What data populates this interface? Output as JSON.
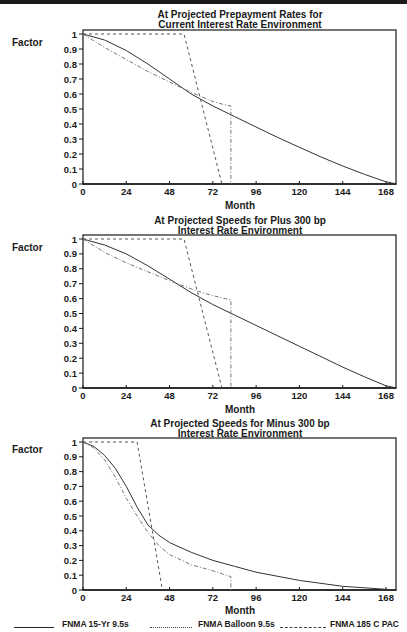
{
  "page": {
    "y_axis_label": "Factor",
    "x_axis_label": "Month"
  },
  "legend": [
    {
      "label": "FNMA 15-Yr 9.5s",
      "style": "solid"
    },
    {
      "label": "FNMA Balloon 9.5s",
      "style": "dashdot"
    },
    {
      "label": "FNMA 185 C PAC",
      "style": "dashed"
    }
  ],
  "chart_data": [
    {
      "type": "line",
      "title": "At Projected Prepayment Rates for",
      "subtitle": "Current Interest Rate Environment",
      "xlabel": "Month",
      "ylabel": "Factor",
      "xlim": [
        0,
        174
      ],
      "ylim": [
        0,
        1
      ],
      "xticks": [
        0,
        24,
        48,
        72,
        96,
        120,
        144,
        168
      ],
      "yticks": [
        0,
        0.1,
        0.2,
        0.3,
        0.4,
        0.5,
        0.6,
        0.7,
        0.8,
        0.9,
        1
      ],
      "grid": false,
      "series": [
        {
          "name": "FNMA 15-Yr 9.5s",
          "style": "solid",
          "x": [
            0,
            12,
            24,
            36,
            48,
            60,
            72,
            84,
            96,
            108,
            120,
            132,
            144,
            156,
            168,
            174
          ],
          "y": [
            1.0,
            0.96,
            0.89,
            0.8,
            0.7,
            0.6,
            0.52,
            0.45,
            0.38,
            0.31,
            0.245,
            0.18,
            0.12,
            0.065,
            0.015,
            0
          ]
        },
        {
          "name": "FNMA Balloon 9.5s",
          "style": "dashdot",
          "x": [
            0,
            4,
            12,
            24,
            36,
            48,
            60,
            66,
            72,
            78,
            82,
            82
          ],
          "y": [
            1.0,
            0.97,
            0.91,
            0.83,
            0.75,
            0.68,
            0.61,
            0.58,
            0.55,
            0.53,
            0.52,
            0
          ]
        },
        {
          "name": "FNMA 185 C PAC",
          "style": "dashed",
          "x": [
            0,
            56,
            77
          ],
          "y": [
            1.0,
            1.0,
            0
          ]
        }
      ]
    },
    {
      "type": "line",
      "title": "At Projected Speeds for Plus 300 bp",
      "subtitle": "Interest Rate Environment",
      "xlabel": "Month",
      "ylabel": "Factor",
      "xlim": [
        0,
        174
      ],
      "ylim": [
        0,
        1
      ],
      "xticks": [
        0,
        24,
        48,
        72,
        96,
        120,
        144,
        168
      ],
      "yticks": [
        0,
        0.1,
        0.2,
        0.3,
        0.4,
        0.5,
        0.6,
        0.7,
        0.8,
        0.9,
        1
      ],
      "grid": false,
      "series": [
        {
          "name": "FNMA 15-Yr 9.5s",
          "style": "solid",
          "x": [
            0,
            12,
            24,
            36,
            48,
            60,
            72,
            84,
            96,
            108,
            120,
            132,
            144,
            156,
            168,
            174
          ],
          "y": [
            1.0,
            0.96,
            0.9,
            0.82,
            0.73,
            0.64,
            0.56,
            0.49,
            0.42,
            0.35,
            0.28,
            0.21,
            0.14,
            0.075,
            0.015,
            0
          ]
        },
        {
          "name": "FNMA Balloon 9.5s",
          "style": "dashdot",
          "x": [
            0,
            4,
            12,
            24,
            36,
            48,
            60,
            66,
            72,
            82,
            82
          ],
          "y": [
            1.0,
            0.97,
            0.91,
            0.84,
            0.78,
            0.72,
            0.665,
            0.64,
            0.62,
            0.59,
            0
          ]
        },
        {
          "name": "FNMA 185 C PAC",
          "style": "dashed",
          "x": [
            0,
            56,
            77
          ],
          "y": [
            1.0,
            1.0,
            0
          ]
        }
      ]
    },
    {
      "type": "line",
      "title": "At Projected Speeds for Minus 300 bp",
      "subtitle": "Interest Rate Environment",
      "xlabel": "Month",
      "ylabel": "Factor",
      "xlim": [
        0,
        174
      ],
      "ylim": [
        0,
        1
      ],
      "xticks": [
        0,
        24,
        48,
        72,
        96,
        120,
        144,
        168
      ],
      "yticks": [
        0,
        0.1,
        0.2,
        0.3,
        0.4,
        0.5,
        0.6,
        0.7,
        0.8,
        0.9,
        1
      ],
      "grid": false,
      "series": [
        {
          "name": "FNMA 15-Yr 9.5s",
          "style": "solid",
          "x": [
            0,
            6,
            12,
            18,
            24,
            30,
            36,
            42,
            48,
            60,
            72,
            84,
            96,
            120,
            144,
            168,
            174
          ],
          "y": [
            1.0,
            0.97,
            0.91,
            0.82,
            0.7,
            0.56,
            0.44,
            0.37,
            0.32,
            0.255,
            0.2,
            0.16,
            0.12,
            0.065,
            0.025,
            0.005,
            0
          ]
        },
        {
          "name": "FNMA Balloon 9.5s",
          "style": "dashdot",
          "x": [
            0,
            6,
            12,
            18,
            24,
            30,
            36,
            42,
            48,
            60,
            72,
            82,
            82
          ],
          "y": [
            1.0,
            0.96,
            0.88,
            0.76,
            0.62,
            0.5,
            0.39,
            0.3,
            0.24,
            0.17,
            0.13,
            0.09,
            0
          ]
        },
        {
          "name": "FNMA 185 C PAC",
          "style": "dashed",
          "x": [
            0,
            30,
            44
          ],
          "y": [
            1.0,
            1.0,
            0
          ]
        }
      ]
    }
  ]
}
